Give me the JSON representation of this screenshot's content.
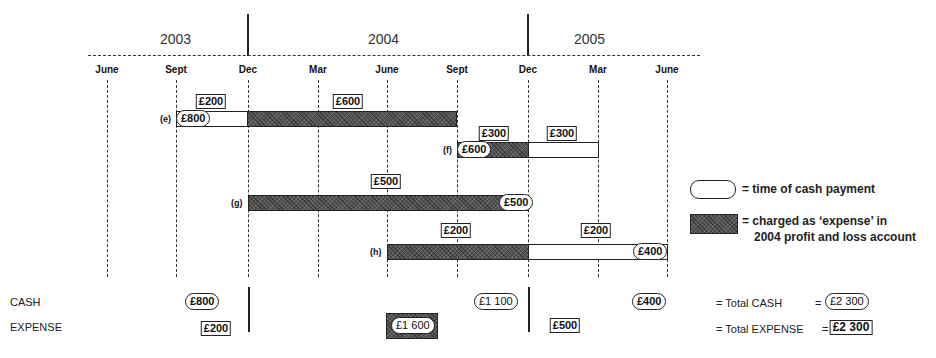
{
  "years": [
    "2003",
    "2004",
    "2005"
  ],
  "months": [
    "June",
    "Sept",
    "Dec",
    "Mar",
    "June",
    "Sept",
    "Dec",
    "Mar",
    "June"
  ],
  "rows": {
    "e": {
      "tag": "(e)",
      "cash": "£800",
      "labels": [
        "£200",
        "£600"
      ]
    },
    "f": {
      "tag": "(f)",
      "cash": "£600",
      "labels": [
        "£300",
        "£300"
      ]
    },
    "g": {
      "tag": "(g)",
      "cash": "£500",
      "labels": [
        "£500"
      ]
    },
    "h": {
      "tag": "(h)",
      "cash": "£400",
      "labels": [
        "£200",
        "£200"
      ]
    }
  },
  "legend": {
    "cash_text": "= time of cash payment",
    "expense_line1": "= charged as ‘expense’ in",
    "expense_line2": "2004 profit and loss account"
  },
  "summary": {
    "cash_label": "CASH",
    "expense_label": "EXPENSE",
    "cash_values": [
      "£800",
      "£1 100",
      "£400"
    ],
    "expense_values": [
      "£200",
      "£1 600",
      "£500"
    ],
    "total_cash_label": "= Total CASH",
    "total_cash_value": "£2 300",
    "total_expense_label": "= Total EXPENSE",
    "total_expense_value": "£2 300",
    "equals": "="
  }
}
